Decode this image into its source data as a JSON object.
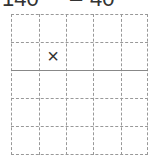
{
  "header": {
    "left_text": "140",
    "dash": "–",
    "right_text": "40"
  },
  "grid": {
    "columns": 5,
    "rows": 5,
    "col_x": [
      0,
      28,
      55,
      82,
      110,
      137
    ],
    "row_y": [
      0,
      28,
      56,
      84,
      112,
      141
    ],
    "solid_row_line_index": 2,
    "line_color": "#999999"
  },
  "marks": [
    {
      "row": 1,
      "col": 1,
      "symbol": "×"
    }
  ]
}
